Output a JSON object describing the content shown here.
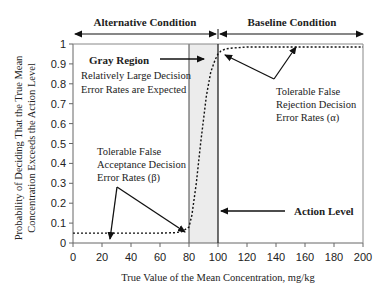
{
  "chart_data": {
    "type": "line",
    "title": "",
    "xlabel": "True Value of the Mean Concentration, mg/kg",
    "ylabel_lines": [
      "Probability of Deciding That the True Mean",
      "Concentration Exceeds the Action Level"
    ],
    "xlim": [
      0,
      200
    ],
    "ylim": [
      0,
      1
    ],
    "x_ticks": [
      "0",
      "20",
      "40",
      "60",
      "80",
      "100",
      "120",
      "140",
      "160",
      "180",
      "200"
    ],
    "y_ticks": [
      "0",
      "0.1",
      "0.2",
      "0.3",
      "0.4",
      "0.5",
      "0.6",
      "0.7",
      "0.8",
      "0.9",
      "1"
    ],
    "grid": false,
    "series": [
      {
        "name": "Decision performance curve",
        "style": "dotted",
        "x": [
          0,
          20,
          40,
          60,
          70,
          75,
          80,
          82,
          85,
          88,
          90,
          92,
          95,
          98,
          100,
          102,
          105,
          110,
          120,
          140,
          160,
          180,
          200
        ],
        "y": [
          0.05,
          0.05,
          0.05,
          0.05,
          0.052,
          0.057,
          0.08,
          0.14,
          0.3,
          0.5,
          0.62,
          0.74,
          0.86,
          0.92,
          0.95,
          0.965,
          0.975,
          0.98,
          0.985,
          0.985,
          0.985,
          0.985,
          0.985
        ]
      }
    ],
    "gray_region": {
      "x_start": 80,
      "x_end": 100,
      "color": "#ececec"
    },
    "action_level": 100,
    "annotations": {
      "alternative_condition": "Alternative Condition",
      "baseline_condition": "Baseline Condition",
      "gray_region_title": "Gray Region",
      "gray_region_desc": [
        "Relatively Large Decision",
        "Error Rates are Expected"
      ],
      "false_rejection": [
        "Tolerable False",
        "Rejection Decision",
        "Error Rates (α)"
      ],
      "false_acceptance": [
        "Tolerable False",
        "Acceptance Decision",
        "Error Rates (β)"
      ],
      "action_level_label": "Action Level"
    }
  }
}
